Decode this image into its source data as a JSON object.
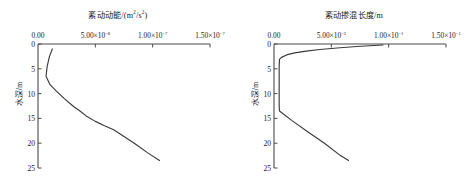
{
  "figure": {
    "panels": [
      {
        "id": "tke-panel",
        "title_text": "紊动动能/(m",
        "title_sup1": "2",
        "title_mid": "/s",
        "title_sup2": "2",
        "title_end": ")",
        "title_full": "紊动动能/(m2/s2)",
        "ylabel": "水深/m",
        "xticks": [
          {
            "value": 0,
            "mantissa": "0.00",
            "exp": ""
          },
          {
            "value": 5e-08,
            "mantissa": "5.00×10",
            "exp": "-8"
          },
          {
            "value": 1e-07,
            "mantissa": "1.00×10",
            "exp": "-7"
          },
          {
            "value": 1.5e-07,
            "mantissa": "1.50×10",
            "exp": "-7"
          }
        ],
        "yticks": [
          "0",
          "5",
          "10",
          "15",
          "20",
          "25"
        ]
      },
      {
        "id": "mixing-length-panel",
        "title_text": "紊动掺混长度/m",
        "title_sup1": "",
        "title_mid": "",
        "title_sup2": "",
        "title_end": "",
        "title_full": "紊动掺混长度/m",
        "ylabel": "水深/m",
        "xticks": [
          {
            "value": 0,
            "mantissa": "0.00",
            "exp": ""
          },
          {
            "value": 0.05,
            "mantissa": "5.00×10",
            "exp": "-2"
          },
          {
            "value": 0.1,
            "mantissa": "1.00×10",
            "exp": "-1"
          },
          {
            "value": 0.15,
            "mantissa": "1.50×10",
            "exp": "-1"
          }
        ],
        "yticks": [
          "0",
          "5",
          "10",
          "15",
          "20",
          "25"
        ]
      }
    ],
    "line_color": "#3a3a3a",
    "axis_color": "#4a4a4a"
  },
  "chart_data": [
    {
      "type": "line",
      "title": "紊动动能/(m2/s2)",
      "xlabel": "紊动动能/(m2/s2)",
      "ylabel": "水深/m",
      "xlim": [
        0,
        1.5e-07
      ],
      "ylim": [
        0,
        25
      ],
      "y_inverted": true,
      "grid": false,
      "legend": "none",
      "xticks": [
        0,
        5e-08,
        1e-07,
        1.5e-07
      ],
      "xticklabels": [
        "0.00",
        "5.00×10^-8",
        "1.00×10^-7",
        "1.50×10^-7"
      ],
      "yticks": [
        0,
        5,
        10,
        15,
        20,
        25
      ],
      "yticklabels": [
        "0",
        "5",
        "10",
        "15",
        "20",
        "25"
      ],
      "series": [
        {
          "name": "紊动动能",
          "x": [
            1.25e-08,
            1e-08,
            8e-09,
            7e-09,
            1.05e-08,
            1.6e-08,
            2.3e-08,
            3.1e-08,
            3.6e-08,
            4.2e-08,
            5e-08,
            5.8e-08,
            6.6e-08,
            7.2e-08,
            8.4e-08,
            9.6e-08,
            1.06e-07
          ],
          "y": [
            1.0,
            2.5,
            4.5,
            6.5,
            8.2,
            9.5,
            11.0,
            12.6,
            13.4,
            14.5,
            15.6,
            16.5,
            17.3,
            18.2,
            20.0,
            22.0,
            23.5
          ]
        }
      ]
    },
    {
      "type": "line",
      "title": "紊动掺混长度/m",
      "xlabel": "紊动掺混长度/m",
      "ylabel": "水深/m",
      "xlim": [
        0,
        0.15
      ],
      "ylim": [
        0,
        25
      ],
      "y_inverted": true,
      "grid": false,
      "legend": "none",
      "xticks": [
        0,
        0.05,
        0.1,
        0.15
      ],
      "xticklabels": [
        "0.00",
        "5.00×10^-2",
        "1.00×10^-1",
        "1.50×10^-1"
      ],
      "yticks": [
        0,
        5,
        10,
        15,
        20,
        25
      ],
      "yticklabels": [
        "0",
        "5",
        "10",
        "15",
        "20",
        "25"
      ],
      "series": [
        {
          "name": "紊动掺混长度",
          "x": [
            0.095,
            0.072,
            0.055,
            0.04,
            0.028,
            0.018,
            0.011,
            0.0065,
            0.0048,
            0.0045,
            0.0045,
            0.0045,
            0.0045,
            0.0048,
            0.016,
            0.03,
            0.044,
            0.058,
            0.065
          ],
          "y": [
            0.2,
            0.5,
            0.8,
            1.1,
            1.45,
            1.8,
            2.2,
            2.7,
            3.1,
            4.5,
            7.0,
            10.0,
            12.5,
            13.5,
            15.5,
            17.8,
            20.0,
            22.5,
            23.5
          ]
        }
      ]
    }
  ]
}
